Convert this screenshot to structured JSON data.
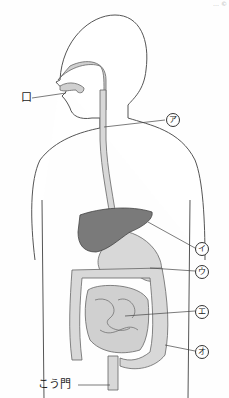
{
  "diagram": {
    "top_note": "… ©",
    "labels": {
      "mouth": "口",
      "a": "ア",
      "i": "イ",
      "u": "ウ",
      "e": "エ",
      "o": "オ",
      "anus": "こう門"
    },
    "colors": {
      "outline": "#555555",
      "organ_fill": "#d8d8d8",
      "liver_fill": "#7a7a7a",
      "body_fill": "#ffffff"
    }
  }
}
